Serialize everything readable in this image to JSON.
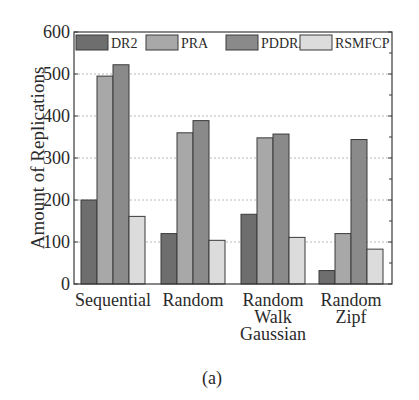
{
  "chart_data": {
    "type": "bar",
    "title": "",
    "caption": "(a)",
    "xlabel": "",
    "ylabel": "Amount of Replications",
    "ylim": [
      0,
      600
    ],
    "yticks": [
      0,
      100,
      200,
      300,
      400,
      500,
      600
    ],
    "grid": "horizontal dashed",
    "legend_position": "top inside",
    "categories": [
      [
        "Sequential"
      ],
      [
        "Random"
      ],
      [
        "Random",
        "Walk",
        "Gaussian"
      ],
      [
        "Random",
        "Zipf"
      ]
    ],
    "series": [
      {
        "name": "DR2",
        "color": "#6e6e6e",
        "values": [
          200,
          120,
          166,
          32
        ]
      },
      {
        "name": "PRA",
        "color": "#a8a8a8",
        "values": [
          495,
          360,
          348,
          120
        ]
      },
      {
        "name": "PDDRA",
        "color": "#8a8a8a",
        "values": [
          522,
          389,
          357,
          344
        ]
      },
      {
        "name": "RSMFCP",
        "color": "#dcdcdc",
        "values": [
          161,
          104,
          111,
          83
        ]
      }
    ]
  }
}
